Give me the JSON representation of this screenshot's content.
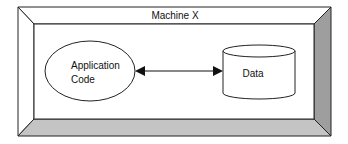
{
  "diagram": {
    "container": {
      "label": "Machine X",
      "bevel_colors": {
        "right": "#9e9e9e",
        "bottom": "#c4c4c4",
        "top": "#ffffff",
        "left": "#ffffff"
      },
      "stroke": "#222222"
    },
    "nodes": [
      {
        "id": "app",
        "shape": "ellipse",
        "label_line1": "Application",
        "label_line2": "Code"
      },
      {
        "id": "data",
        "shape": "cylinder",
        "label": "Data"
      }
    ],
    "edges": [
      {
        "from": "app",
        "to": "data",
        "style": "bidirectional-arrow"
      }
    ]
  }
}
